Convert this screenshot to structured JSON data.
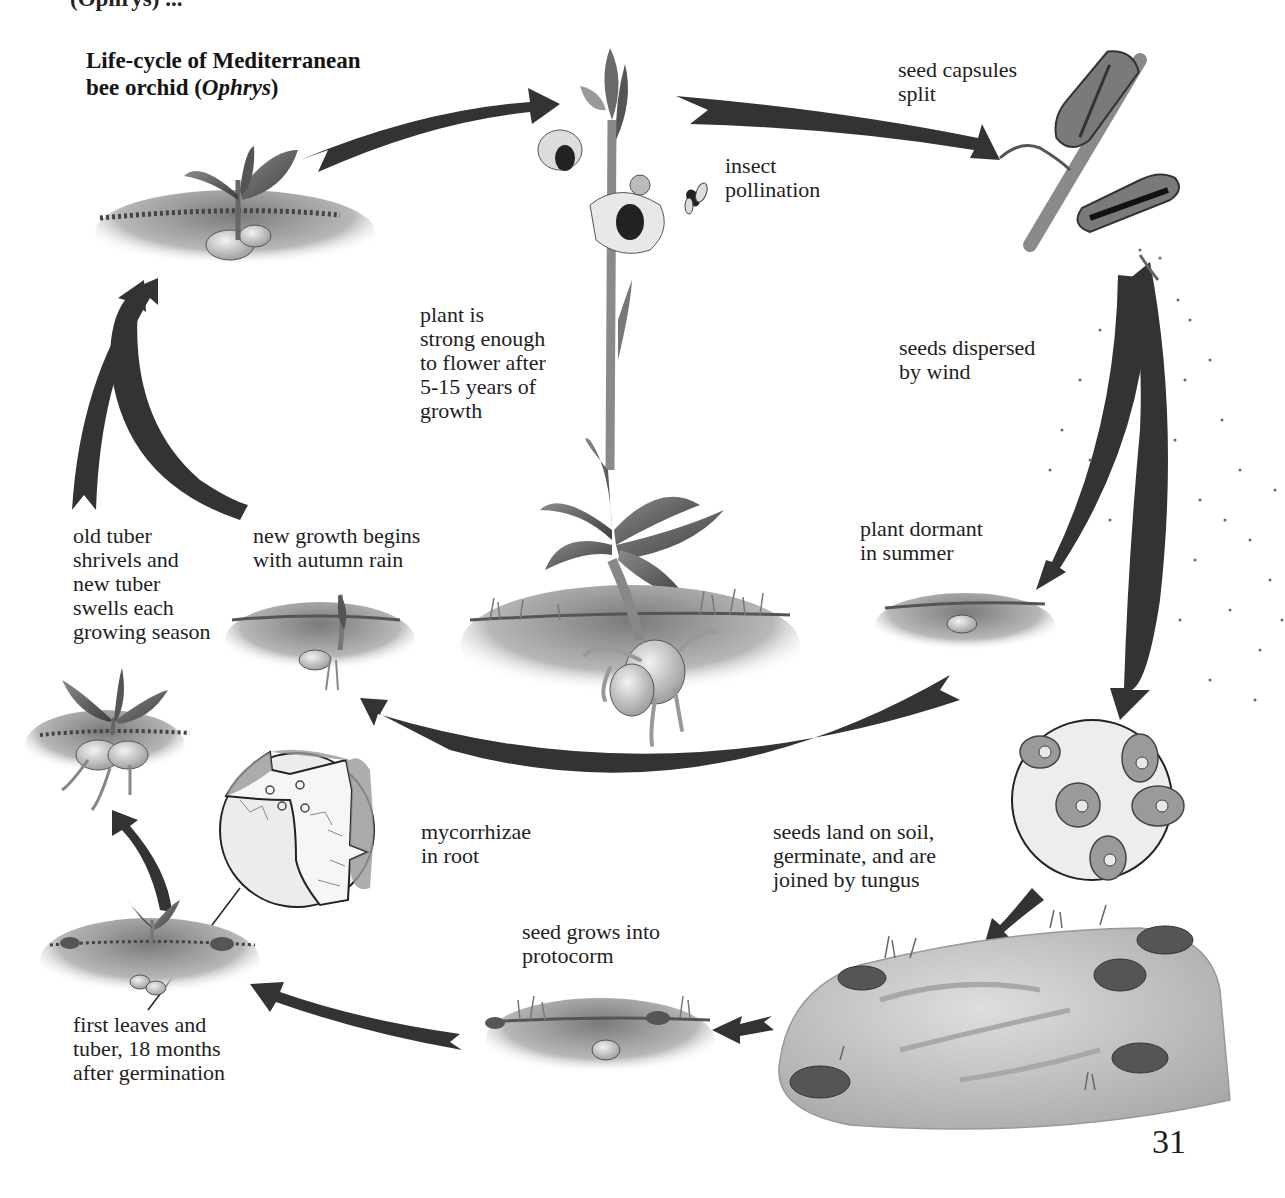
{
  "title": {
    "line1": "Life-cycle of Mediterranean",
    "line2_prefix": "bee orchid (",
    "line2_italic": "Ophrys",
    "line2_suffix": ")"
  },
  "top_cutoff_text": "(Ophrys) ...",
  "labels": {
    "seed_capsules": "seed capsules\nsplit",
    "insect_pollination": "insect\npollination",
    "plant_strong": "plant is\nstrong enough\nto flower after\n5-15 years of\ngrowth",
    "seeds_dispersed": "seeds dispersed\nby wind",
    "plant_dormant": "plant dormant\nin summer",
    "old_tuber": "old tuber\nshrivels and\nnew tuber\nswells each\ngrowing season",
    "new_growth": "new growth begins\nwith autumn rain",
    "mycorrhizae": "mycorrhizae\nin root",
    "seeds_land": "seeds land on soil,\ngerminate, and are\njoined by tungus",
    "seed_grows": "seed grows into\nprotocorm",
    "first_leaves": "first leaves and\ntuber, 18 months\nafter germination"
  },
  "page_number": "31",
  "colors": {
    "arrow": "#333333",
    "soil": "#8a8a8a",
    "leaf": "#5a5a5a",
    "tuber": "#d8d8d8",
    "rock": "#c9c9c9",
    "circle_bg": "#e6e6e6"
  },
  "stages": [
    "young plant with tuber (autumn)",
    "flowering bee orchid",
    "split seed capsules",
    "seeds dispersed by wind",
    "plant dormant in summer",
    "seeds germinate on soil with fungus",
    "seed grows into protocorm",
    "first leaves and tuber",
    "tuber swells each season",
    "new growth with autumn rain"
  ]
}
